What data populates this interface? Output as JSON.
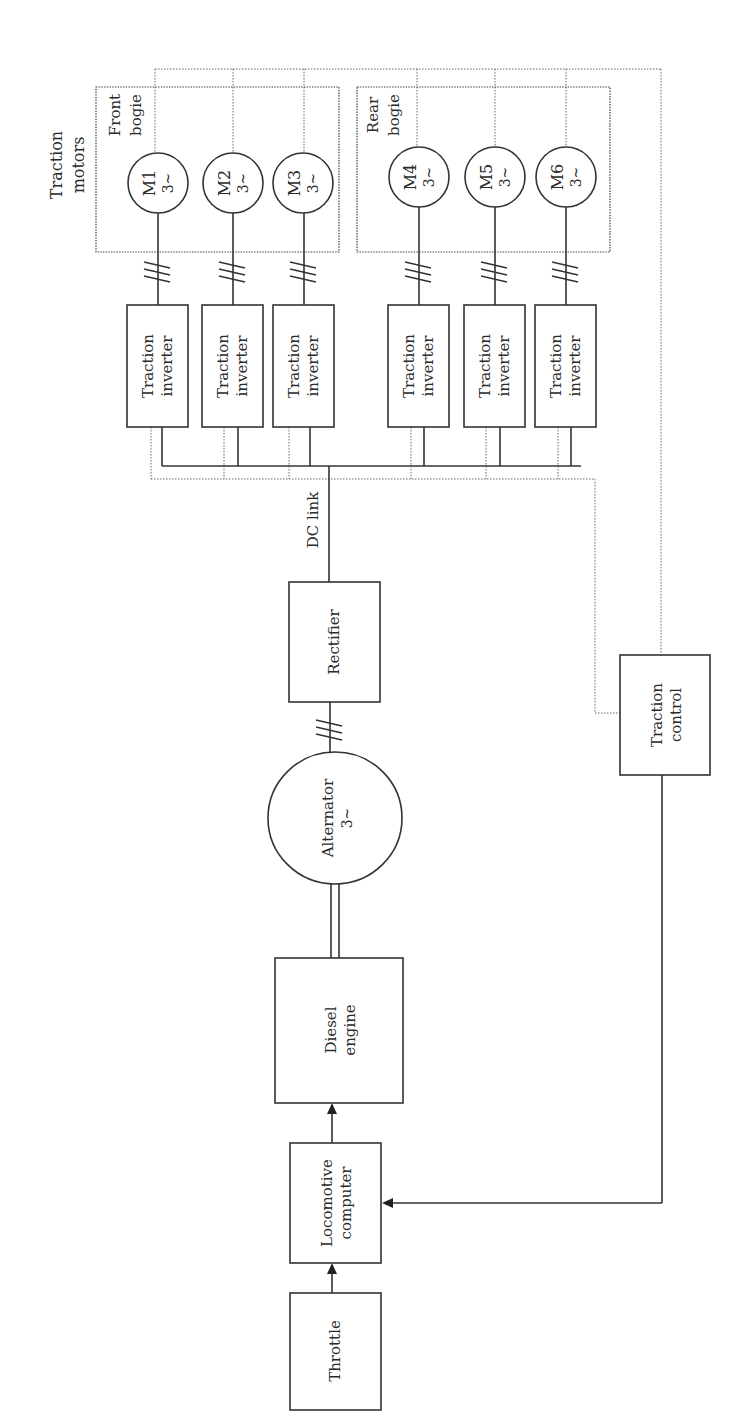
{
  "diagram": {
    "title_labels": {
      "traction_motors_line1": "Traction",
      "traction_motors_line2": "motors",
      "front_bogie_line1": "Front",
      "front_bogie_line2": "bogie",
      "rear_bogie_line1": "Rear",
      "rear_bogie_line2": "bogie",
      "dc_link": "DC link"
    },
    "motors": [
      {
        "id": "M1",
        "phase": "3~"
      },
      {
        "id": "M2",
        "phase": "3~"
      },
      {
        "id": "M3",
        "phase": "3~"
      },
      {
        "id": "M4",
        "phase": "3~"
      },
      {
        "id": "M5",
        "phase": "3~"
      },
      {
        "id": "M6",
        "phase": "3~"
      }
    ],
    "inverters": [
      {
        "line1": "Traction",
        "line2": "inverter"
      },
      {
        "line1": "Traction",
        "line2": "inverter"
      },
      {
        "line1": "Traction",
        "line2": "inverter"
      },
      {
        "line1": "Traction",
        "line2": "inverter"
      },
      {
        "line1": "Traction",
        "line2": "inverter"
      },
      {
        "line1": "Traction",
        "line2": "inverter"
      }
    ],
    "rectifier": {
      "label": "Rectifier"
    },
    "alternator": {
      "line1": "Alternator",
      "line2": "3~"
    },
    "diesel_engine": {
      "line1": "Diesel",
      "line2": "engine"
    },
    "locomotive_computer": {
      "line1": "Locomotive",
      "line2": "computer"
    },
    "throttle": {
      "label": "Throttle"
    },
    "traction_control": {
      "line1": "Traction",
      "line2": "control"
    },
    "three_phase_marker": "///"
  }
}
